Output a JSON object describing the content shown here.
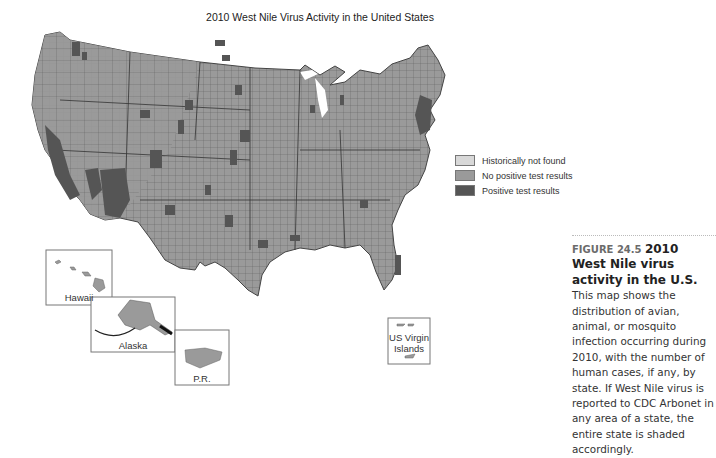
{
  "title": "2010 West Nile Virus Activity in the United States",
  "legend": {
    "items": [
      {
        "label": "Historically not found",
        "color": "#d8d8d8"
      },
      {
        "label": "No positive test results",
        "color": "#9a9a9a"
      },
      {
        "label": "Positive test results",
        "color": "#555555"
      }
    ]
  },
  "insets": {
    "hawaii": "Hawaii",
    "alaska": "Alaska",
    "pr": "P.R.",
    "usvi_line1": "US Virgin",
    "usvi_line2": "Islands"
  },
  "caption": {
    "figure_number": "FIGURE 24.5",
    "figure_title": "2010 West Nile virus activity in the U.S.",
    "body": "This map shows the distribution of avian, animal, or mosquito infection occurring during 2010, with the number of human cases, if any, by state. If West Nile virus is reported to CDC Arbonet in any area of a state, the entire state is shaded accordingly."
  },
  "colors": {
    "land": "#9a9a9a",
    "positive": "#555555",
    "border": "#444444"
  }
}
